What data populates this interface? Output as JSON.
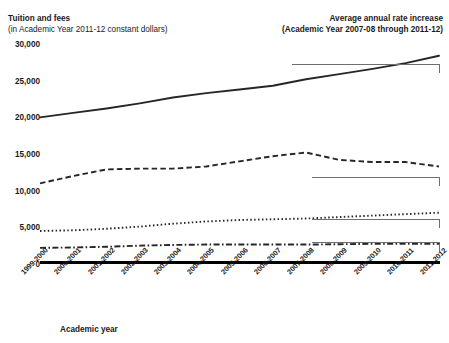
{
  "header": {
    "left_title": "Tuition and fees",
    "left_subtitle": "(in Academic Year 2011-12 constant dollars)",
    "right_title": "Average annual rate increase",
    "right_subtitle": "(Academic Year 2007-08 through 2011-12)"
  },
  "axis_title": "Academic year",
  "chart_data": {
    "type": "line",
    "title": "Tuition and fees",
    "subtitle": "(in Academic Year 2011-12 constant dollars)",
    "xlabel": "Academic year",
    "ylabel": "Tuition and fees",
    "ylim": [
      0,
      30000
    ],
    "yticks": [
      0,
      5000,
      10000,
      15000,
      20000,
      25000,
      30000
    ],
    "ytick_labels": [
      "0",
      "5,000",
      "10,000",
      "15,000",
      "20,000",
      "25,000",
      "30,000"
    ],
    "grid": false,
    "legend": "right-annotations",
    "categories": [
      "1999-2000",
      "2000-2001",
      "2001-2002",
      "2002-2003",
      "2003-2004",
      "2004-2005",
      "2005-2006",
      "2006-2007",
      "2007-2008",
      "2008-2009",
      "2009-2010",
      "2010-2011",
      "2011-2012"
    ],
    "series": [
      {
        "name": "Private nonprofit 4-year",
        "style": "solid",
        "rate_increase": "2%",
        "annotation": "2% Private nonprofit 4-year",
        "values": [
          20000,
          20600,
          21200,
          21900,
          22700,
          23300,
          23800,
          24300,
          25200,
          25900,
          26600,
          27400,
          28400
        ]
      },
      {
        "name": "For-profit 2- and 4-year",
        "style": "dashed",
        "rate_increase": "-3%",
        "annotation": "-3% For-profit 2- and 4-year",
        "values": [
          11000,
          12000,
          12900,
          13000,
          13000,
          13300,
          14000,
          14700,
          15200,
          14200,
          13900,
          13900,
          13300
        ]
      },
      {
        "name": "Public 4-year",
        "style": "dotted",
        "rate_increase": "5%",
        "annotation": "5% Public 4-year",
        "values": [
          4500,
          4600,
          4800,
          5100,
          5500,
          5800,
          6000,
          6100,
          6200,
          6400,
          6600,
          6800,
          7000
        ]
      },
      {
        "name": "Public 2-year",
        "style": "dashdot",
        "rate_increase": "5%",
        "annotation": "5% Public 2-year",
        "values": [
          2200,
          2250,
          2350,
          2500,
          2600,
          2650,
          2650,
          2650,
          2650,
          2700,
          2750,
          2750,
          2750
        ]
      }
    ]
  }
}
